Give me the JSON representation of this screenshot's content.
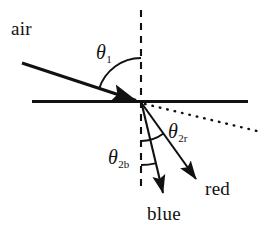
{
  "figure": {
    "kind": "optics-refraction-dispersion-diagram",
    "background_color": "#ffffff",
    "ink_color": "#111111"
  },
  "labels": {
    "air": "air",
    "red": "red",
    "blue": "blue",
    "theta1": {
      "symbol": "θ",
      "subscript": "1"
    },
    "theta2r": {
      "symbol": "θ",
      "subscript": "2r"
    },
    "theta2b": {
      "symbol": "θ",
      "subscript": "2b"
    }
  },
  "geometry": {
    "vertex": {
      "x": 141,
      "y": 102
    },
    "interface_line": {
      "x1": 32,
      "y1": 101,
      "x2": 248,
      "y2": 101,
      "style": "solid",
      "width": 3
    },
    "normal_line": {
      "x1": 141,
      "y1": 10,
      "x2": 141,
      "y2": 186,
      "style": "dashed",
      "width": 2
    },
    "incident_ray": {
      "x1": 22,
      "y1": 63,
      "x2": 141,
      "y2": 102,
      "style": "solid",
      "width": 3,
      "arrow": "filled"
    },
    "red_ray": {
      "x1": 141,
      "y1": 103,
      "x2": 200,
      "y2": 186,
      "style": "solid",
      "width": 2,
      "arrow": "filled"
    },
    "blue_ray": {
      "x1": 141,
      "y1": 103,
      "x2": 166,
      "y2": 201,
      "style": "solid",
      "width": 2,
      "arrow": "filled"
    },
    "dotted_continuation": {
      "x1": 144,
      "y1": 104,
      "x2": 257,
      "y2": 131,
      "style": "dotted",
      "width": 2
    },
    "arc_theta1": {
      "radius": 44,
      "from_deg": 270,
      "to_deg": 198
    },
    "arc_theta2r": {
      "radius": 38,
      "from_deg": 90,
      "to_deg": 54
    },
    "arc_theta2b": {
      "radius": 62,
      "from_deg": 90,
      "to_deg": 76
    }
  }
}
